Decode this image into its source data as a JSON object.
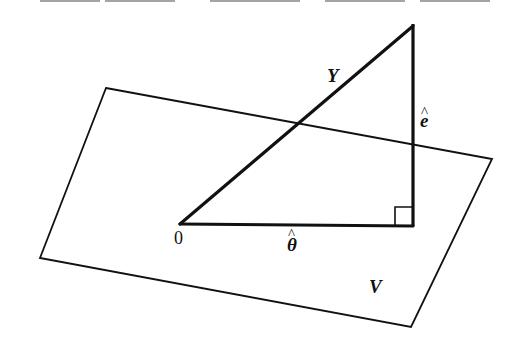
{
  "diagram": {
    "type": "orthogonal projection onto subspace",
    "colors": {
      "stroke": "#111111",
      "background": "#ffffff"
    },
    "plane": {
      "label": "V",
      "corners": [
        [
          106,
          88
        ],
        [
          492,
          159
        ],
        [
          411,
          327
        ],
        [
          40,
          258
        ]
      ]
    },
    "points": {
      "origin": {
        "label": "0",
        "x": 180,
        "y": 224
      },
      "foot": {
        "x": 413,
        "y": 226
      },
      "apex": {
        "x": 413,
        "y": 24
      }
    },
    "vectors": [
      {
        "id": "Y",
        "label": "Y",
        "from": "origin",
        "to": "apex"
      },
      {
        "id": "theta_hat",
        "label": "θ̂",
        "base": "θ",
        "hat": "^",
        "from": "origin",
        "to": "foot"
      },
      {
        "id": "e_hat",
        "label": "ê",
        "base": "e",
        "hat": "^",
        "from": "foot",
        "to": "apex"
      }
    ],
    "right_angle_marker": {
      "at": "foot",
      "size": 16
    }
  }
}
